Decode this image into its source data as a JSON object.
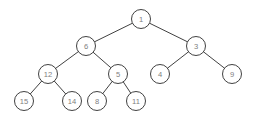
{
  "figure": {
    "type": "binary-tree-diagram",
    "title": "",
    "background_color": "#ffffff",
    "node_fill": "#ffffff",
    "node_stroke": "#2b2b2b",
    "label_color": "#808080",
    "edge_color": "#2b2b2b",
    "node_radius": 9.5,
    "width": 258,
    "height": 120
  },
  "chart_data": {
    "type": "diagram",
    "subtype": "binary-tree",
    "title": "",
    "nodes": [
      {
        "id": "n1",
        "label": "1",
        "x": 141,
        "y": 19,
        "depth": 0
      },
      {
        "id": "n6",
        "label": "6",
        "x": 86,
        "y": 46,
        "depth": 1
      },
      {
        "id": "n3",
        "label": "3",
        "x": 196,
        "y": 46,
        "depth": 1
      },
      {
        "id": "n12",
        "label": "12",
        "x": 48,
        "y": 74,
        "depth": 2
      },
      {
        "id": "n5",
        "label": "5",
        "x": 118,
        "y": 74,
        "depth": 2
      },
      {
        "id": "n4",
        "label": "4",
        "x": 160,
        "y": 74,
        "depth": 2
      },
      {
        "id": "n9",
        "label": "9",
        "x": 232,
        "y": 74,
        "depth": 2
      },
      {
        "id": "n15",
        "label": "15",
        "x": 24,
        "y": 101,
        "depth": 3
      },
      {
        "id": "n14",
        "label": "14",
        "x": 72,
        "y": 101,
        "depth": 3
      },
      {
        "id": "n8",
        "label": "8",
        "x": 97,
        "y": 101,
        "depth": 3
      },
      {
        "id": "n11",
        "label": "11",
        "x": 136,
        "y": 101,
        "depth": 3
      }
    ],
    "edges": [
      {
        "from": "n1",
        "to": "n6"
      },
      {
        "from": "n1",
        "to": "n3"
      },
      {
        "from": "n6",
        "to": "n12"
      },
      {
        "from": "n6",
        "to": "n5"
      },
      {
        "from": "n3",
        "to": "n4"
      },
      {
        "from": "n3",
        "to": "n9"
      },
      {
        "from": "n12",
        "to": "n15"
      },
      {
        "from": "n12",
        "to": "n14"
      },
      {
        "from": "n5",
        "to": "n8"
      },
      {
        "from": "n5",
        "to": "n11"
      }
    ]
  }
}
